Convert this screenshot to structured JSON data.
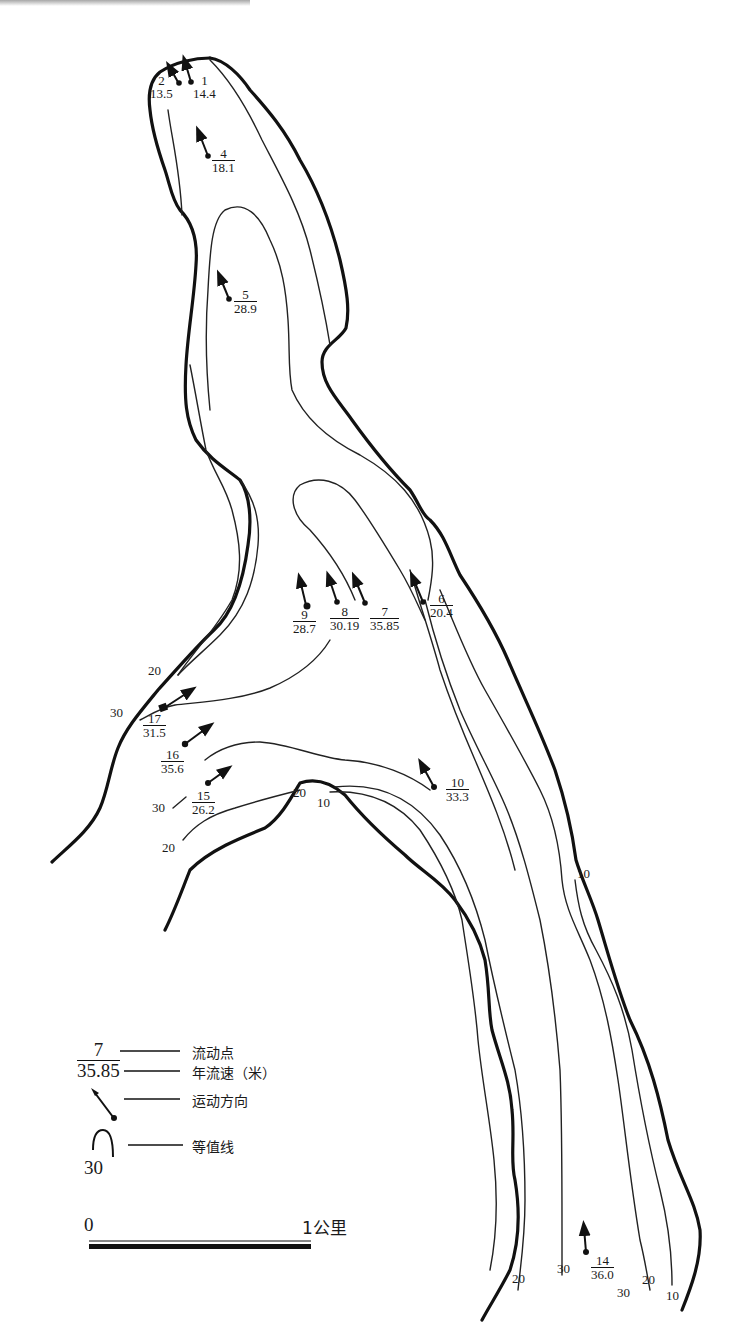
{
  "map": {
    "title_cut_off": "",
    "flow_points": [
      {
        "id": "2",
        "speed": "13.5",
        "label_num": "2",
        "label_den": "13.5"
      },
      {
        "id": "1",
        "speed": "14.4",
        "label_num": "1",
        "label_den": "14.4"
      },
      {
        "id": "4",
        "speed": "18.1",
        "label_num": "4",
        "label_den": "18.1"
      },
      {
        "id": "5",
        "speed": "28.9",
        "label_num": "5",
        "label_den": "28.9"
      },
      {
        "id": "9",
        "speed": "28.7",
        "label_num": "9",
        "label_den": "28.7"
      },
      {
        "id": "8",
        "speed": "30.19",
        "label_num": "8",
        "label_den": "30.19"
      },
      {
        "id": "7",
        "speed": "35.85",
        "label_num": "7",
        "label_den": "35.85"
      },
      {
        "id": "6",
        "speed": "20.4",
        "label_num": "6",
        "label_den": "20.4"
      },
      {
        "id": "17",
        "speed": "31.5",
        "label_num": "17",
        "label_den": "31.5"
      },
      {
        "id": "16",
        "speed": "35.6",
        "label_num": "16",
        "label_den": "35.6"
      },
      {
        "id": "15",
        "speed": "26.2",
        "label_num": "15",
        "label_den": "26.2"
      },
      {
        "id": "10",
        "speed": "33.3",
        "label_num": "10",
        "label_den": "33.3"
      },
      {
        "id": "14",
        "speed": "36.0",
        "label_num": "14",
        "label_den": "36.0"
      }
    ],
    "isoline_labels": {
      "left_20": "20",
      "left_30": "30",
      "bay_30": "30",
      "bay_20": "20",
      "spit_20": "20",
      "spit_10": "10",
      "right_10": "10",
      "bottom_20a": "20",
      "bottom_30a": "30",
      "bottom_30b": "30",
      "bottom_20b": "20",
      "bottom_10": "10"
    }
  },
  "legend": {
    "sample_num": "7",
    "sample_den": "35.85",
    "flow_point": "流动点",
    "annual_speed": "年流速（米）",
    "direction": "运动方向",
    "isoline": "等值线",
    "isoline_sample": "30"
  },
  "scale": {
    "start": "0",
    "end": "1公里"
  }
}
